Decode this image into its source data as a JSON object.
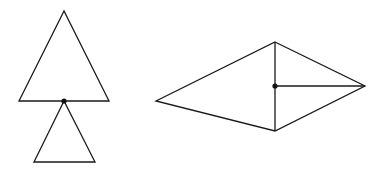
{
  "diagram": {
    "figures": [
      {
        "name": "triangle-pair",
        "large_triangle": {
          "points": [
            [
              64,
              11
            ],
            [
              19,
              101
            ],
            [
              109,
              101
            ]
          ]
        },
        "small_triangle": {
          "points": [
            [
              64,
              101
            ],
            [
              34,
              162
            ],
            [
              95,
              162
            ]
          ]
        },
        "shared_vertex_dot": {
          "cx": 64,
          "cy": 101,
          "r": 2.6
        }
      },
      {
        "name": "kite",
        "outline": {
          "points": [
            [
              275,
              42
            ],
            [
              365,
              86
            ],
            [
              275,
              131
            ],
            [
              156,
              101
            ]
          ]
        },
        "vertical_segment": {
          "x1": 275,
          "y1": 42,
          "x2": 275,
          "y2": 131
        },
        "horizontal_segment": {
          "x1": 275,
          "y1": 86,
          "x2": 365,
          "y2": 86
        },
        "center_dot": {
          "cx": 275,
          "cy": 86,
          "r": 2.6
        }
      }
    ],
    "colors": {
      "line": "#1a1a1a",
      "dot": "#111111",
      "background": "#ffffff"
    }
  }
}
